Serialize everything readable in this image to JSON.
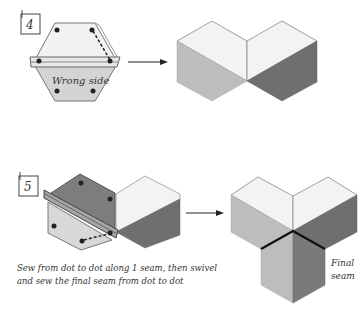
{
  "steps": [
    {
      "number": "4",
      "label_wrong_side": "Wrong side"
    },
    {
      "number": "5",
      "caption_line1": "Sew from dot to dot along 1 seam, then swivel",
      "caption_line2": "and sew the final seam from dot to dot",
      "label_final_seam_line1": "Final",
      "label_final_seam_line2": "seam"
    }
  ],
  "colors": {
    "light": "#f4f4f4",
    "mid": "#bdbdbd",
    "dark": "#7a7a7a",
    "darker": "#6b6b6b",
    "outline": "#8a8a8a",
    "ink": "#222222"
  }
}
